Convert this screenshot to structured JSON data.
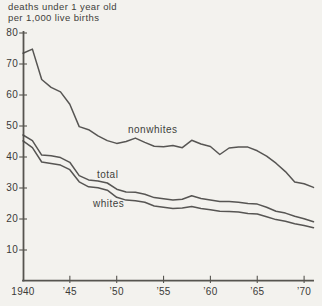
{
  "figure": {
    "title_line1": "deaths under 1 year old",
    "title_line2": "per 1,000 live births",
    "bg_color": "#f3f2ee",
    "line_color": "#4a4947",
    "axis_color": "#56544f",
    "text_color": "#3b3a38"
  },
  "chart_data": {
    "type": "line",
    "title": "deaths under 1 year old per 1,000 live births",
    "xlabel": "",
    "ylabel": "deaths under 1 year old per 1,000 live births",
    "xlim": [
      1940,
      1971
    ],
    "ylim": [
      0,
      80
    ],
    "grid": false,
    "legend_position": "inline-labels",
    "y_ticks": [
      80,
      70,
      60,
      50,
      40,
      30,
      20,
      10
    ],
    "x_tick_labels": [
      "1940",
      "’45",
      "’50",
      "’55",
      "’60",
      "’65",
      "’70"
    ],
    "x_tick_years": [
      1940,
      1945,
      1950,
      1955,
      1960,
      1965,
      1970
    ],
    "x": [
      1940,
      1941,
      1942,
      1943,
      1944,
      1945,
      1946,
      1947,
      1948,
      1949,
      1950,
      1951,
      1952,
      1953,
      1954,
      1955,
      1956,
      1957,
      1958,
      1959,
      1960,
      1961,
      1962,
      1963,
      1964,
      1965,
      1966,
      1967,
      1968,
      1969,
      1970,
      1971
    ],
    "series": [
      {
        "name": "nonwhites",
        "label_pos": {
          "x": 128,
          "y": 124
        },
        "values": [
          73.5,
          74.8,
          65.0,
          62.5,
          61.0,
          57.0,
          49.8,
          48.8,
          46.8,
          45.3,
          44.4,
          45.0,
          46.1,
          44.7,
          43.5,
          43.3,
          43.7,
          43.0,
          45.4,
          44.2,
          43.4,
          40.8,
          42.9,
          43.2,
          43.2,
          42.0,
          40.3,
          38.0,
          35.3,
          31.9,
          31.4,
          30.2
        ]
      },
      {
        "name": "total",
        "label_pos": {
          "x": 97,
          "y": 169
        },
        "values": [
          47.1,
          45.3,
          40.6,
          40.4,
          39.8,
          38.3,
          34.0,
          32.6,
          32.3,
          31.6,
          29.6,
          28.7,
          28.6,
          28.0,
          26.9,
          26.5,
          26.1,
          26.4,
          27.5,
          26.6,
          26.1,
          25.6,
          25.6,
          25.4,
          25.0,
          24.8,
          23.8,
          22.5,
          21.9,
          20.9,
          20.1,
          19.1
        ]
      },
      {
        "name": "whites",
        "label_pos": {
          "x": 93,
          "y": 198
        },
        "values": [
          45.2,
          43.0,
          38.4,
          37.9,
          37.4,
          35.9,
          32.0,
          30.4,
          30.1,
          29.3,
          27.0,
          26.1,
          25.9,
          25.4,
          24.2,
          23.8,
          23.4,
          23.5,
          24.0,
          23.4,
          23.0,
          22.5,
          22.4,
          22.3,
          21.8,
          21.6,
          20.7,
          19.8,
          19.3,
          18.5,
          17.9,
          17.2
        ]
      }
    ]
  }
}
